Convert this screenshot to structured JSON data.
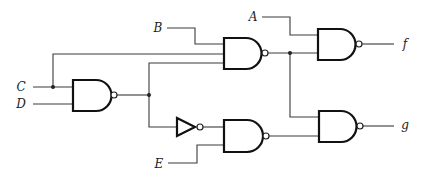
{
  "diagram": {
    "type": "logic-circuit",
    "inputs": [
      {
        "id": "A",
        "label": "A"
      },
      {
        "id": "B",
        "label": "B"
      },
      {
        "id": "C",
        "label": "C"
      },
      {
        "id": "D",
        "label": "D"
      },
      {
        "id": "E",
        "label": "E"
      }
    ],
    "outputs": [
      {
        "id": "f",
        "label": "f"
      },
      {
        "id": "g",
        "label": "g"
      }
    ],
    "gates": [
      {
        "id": "G1",
        "type": "NAND",
        "inputs": [
          "C",
          "D"
        ]
      },
      {
        "id": "G2",
        "type": "NAND",
        "inputs": [
          "B",
          "C",
          "G1"
        ]
      },
      {
        "id": "INV",
        "type": "NOT",
        "inputs": [
          "G1"
        ]
      },
      {
        "id": "G3",
        "type": "NAND",
        "inputs": [
          "A",
          "G2"
        ],
        "output": "f"
      },
      {
        "id": "G4",
        "type": "NAND",
        "inputs": [
          "INV",
          "E"
        ]
      },
      {
        "id": "G5",
        "type": "NAND",
        "inputs": [
          "G2",
          "G4"
        ],
        "output": "g"
      }
    ],
    "colors": {
      "line": "#3a3a3a",
      "gate_outline": "#111111",
      "background": "#ffffff"
    }
  }
}
